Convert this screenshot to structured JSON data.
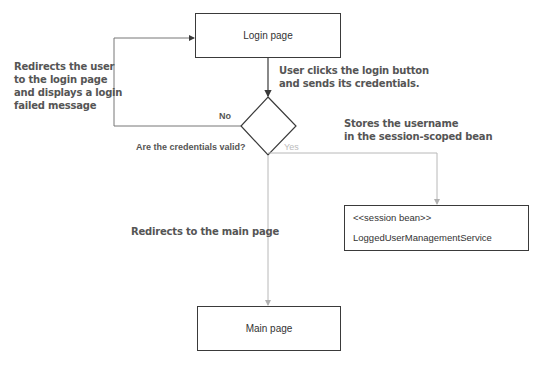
{
  "diagram": {
    "nodes": {
      "login_page": "Login page",
      "decision": "Are the credentials valid?",
      "session_bean_stereotype": "<<session bean>>",
      "session_bean_name": "LoggedUserManagementService",
      "main_page": "Main page"
    },
    "edges": {
      "no_label": "No",
      "yes_label": "Yes"
    },
    "annotations": {
      "redirect_login_lines": [
        "Redirects the user",
        "to the login page",
        "and displays a login",
        "failed message"
      ],
      "user_clicks_lines": [
        "User clicks the login button",
        "and sends its credentials."
      ],
      "stores_lines": [
        "Stores the username",
        "in the session-scoped bean"
      ],
      "redirect_main": "Redirects to the main page"
    },
    "colors": {
      "dark_line": "#3a3a3a",
      "light_line": "#b8b8b8",
      "note_text": "#555555"
    }
  }
}
